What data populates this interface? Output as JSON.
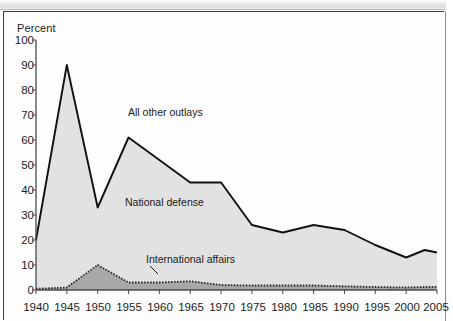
{
  "chart_data": {
    "type": "area",
    "title": "",
    "subtitle": "",
    "xlabel": "",
    "ylabel": "Percent",
    "ylim": [
      0,
      100
    ],
    "xlim": [
      1940,
      2005
    ],
    "grid": false,
    "legend_position": "inline-annotations",
    "stacked": true,
    "y_ticks": [
      "0",
      "10",
      "20",
      "30",
      "40",
      "50",
      "60",
      "70",
      "80",
      "90",
      "100"
    ],
    "x_ticks": [
      "1940",
      "1945",
      "1950",
      "1955",
      "1960",
      "1965",
      "1970",
      "1975",
      "1980",
      "1985",
      "1990",
      "1995",
      "2000",
      "2005"
    ],
    "x": [
      1940,
      1945,
      1950,
      1955,
      1960,
      1965,
      1970,
      1975,
      1980,
      1985,
      1990,
      1995,
      2000,
      2003,
      2005
    ],
    "series": [
      {
        "name": "National defense",
        "annotation": "National defense",
        "color": "#e2e2e2",
        "line_color": "#111111",
        "note": "upper boundary of stacked area; defense share of total outlays",
        "values": [
          20,
          90,
          33,
          61,
          52,
          43,
          43,
          26,
          23,
          26,
          24,
          18,
          13,
          16,
          15
        ]
      },
      {
        "name": "International affairs",
        "annotation": "International affairs",
        "color": "#a8a8a8",
        "line_color": "#2b2b2b",
        "line_style": "dotted",
        "values": [
          0.5,
          1,
          10,
          3,
          3,
          3.5,
          2,
          1.8,
          1.8,
          1.8,
          1.5,
          1.2,
          1,
          1.2,
          1.3
        ]
      }
    ],
    "annotations": [
      {
        "text": "All other outlays",
        "x_pct": 29,
        "y_pct": 33
      },
      {
        "text": "National defense",
        "x_pct": 28,
        "y_pct": 62
      },
      {
        "text": "International affairs",
        "x_pct": 33,
        "y_pct": 81
      }
    ]
  },
  "labels": {
    "y_axis_title": "Percent",
    "all_other_outlays": "All other outlays",
    "national_defense": "National defense",
    "international_affairs": "International affairs"
  },
  "colors": {
    "upper_fill": "#e2e2e2",
    "lower_fill": "#a8a8a8",
    "line": "#111111",
    "axis": "#4a4a4a",
    "text": "#1c1c1c"
  }
}
